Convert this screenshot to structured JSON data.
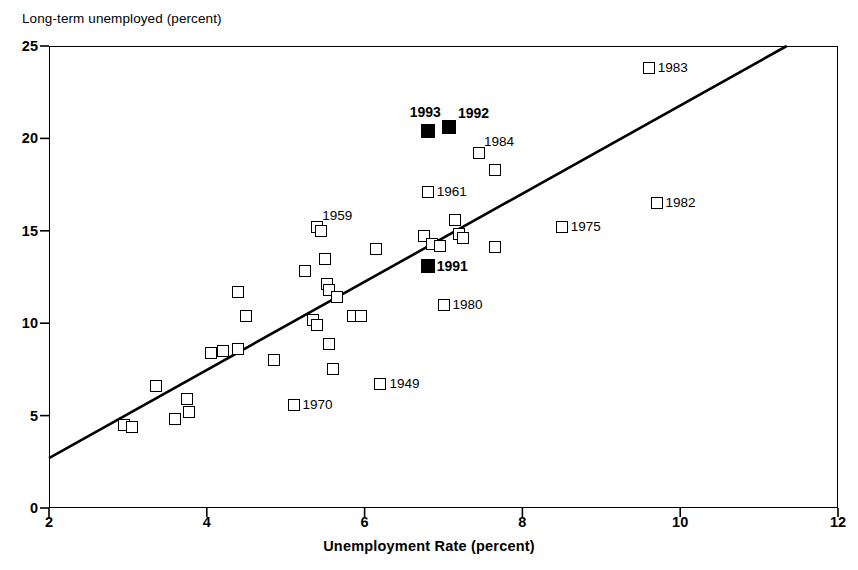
{
  "chart_data": {
    "type": "scatter",
    "title": "",
    "ylabel": "Long-term unemployed (percent)",
    "xlabel": "Unemployment Rate (percent)",
    "xlim": [
      2,
      12
    ],
    "ylim": [
      0,
      25
    ],
    "xticks": [
      "2",
      "4",
      "6",
      "8",
      "10",
      "12"
    ],
    "yticks": [
      "0",
      "5",
      "10",
      "15",
      "20",
      "25"
    ],
    "grid": false,
    "legend": null,
    "series": [
      {
        "name": "Years (open squares)",
        "marker": "open-square",
        "points": [
          {
            "x": 2.95,
            "y": 4.5,
            "label": ""
          },
          {
            "x": 3.05,
            "y": 4.4,
            "label": ""
          },
          {
            "x": 3.35,
            "y": 6.6,
            "label": ""
          },
          {
            "x": 3.6,
            "y": 4.8,
            "label": ""
          },
          {
            "x": 3.75,
            "y": 5.9,
            "label": ""
          },
          {
            "x": 3.78,
            "y": 5.2,
            "label": ""
          },
          {
            "x": 4.05,
            "y": 8.4,
            "label": ""
          },
          {
            "x": 4.2,
            "y": 8.5,
            "label": ""
          },
          {
            "x": 4.4,
            "y": 8.6,
            "label": ""
          },
          {
            "x": 4.4,
            "y": 11.7,
            "label": ""
          },
          {
            "x": 4.5,
            "y": 10.4,
            "label": ""
          },
          {
            "x": 4.85,
            "y": 8.0,
            "label": ""
          },
          {
            "x": 5.1,
            "y": 5.6,
            "label": "1970"
          },
          {
            "x": 5.25,
            "y": 12.8,
            "label": ""
          },
          {
            "x": 5.4,
            "y": 15.2,
            "label": "1959"
          },
          {
            "x": 5.45,
            "y": 15.0,
            "label": ""
          },
          {
            "x": 5.35,
            "y": 10.2,
            "label": ""
          },
          {
            "x": 5.4,
            "y": 9.9,
            "label": ""
          },
          {
            "x": 5.5,
            "y": 13.5,
            "label": ""
          },
          {
            "x": 5.52,
            "y": 12.1,
            "label": ""
          },
          {
            "x": 5.55,
            "y": 11.8,
            "label": ""
          },
          {
            "x": 5.55,
            "y": 8.9,
            "label": ""
          },
          {
            "x": 5.6,
            "y": 7.5,
            "label": ""
          },
          {
            "x": 5.65,
            "y": 11.4,
            "label": ""
          },
          {
            "x": 5.85,
            "y": 10.4,
            "label": ""
          },
          {
            "x": 5.95,
            "y": 10.4,
            "label": ""
          },
          {
            "x": 6.15,
            "y": 14.0,
            "label": ""
          },
          {
            "x": 6.2,
            "y": 6.7,
            "label": "1949"
          },
          {
            "x": 6.75,
            "y": 14.7,
            "label": ""
          },
          {
            "x": 6.8,
            "y": 17.1,
            "label": "1961"
          },
          {
            "x": 6.85,
            "y": 14.3,
            "label": ""
          },
          {
            "x": 6.95,
            "y": 14.2,
            "label": ""
          },
          {
            "x": 7.0,
            "y": 11.0,
            "label": "1980"
          },
          {
            "x": 7.15,
            "y": 15.6,
            "label": ""
          },
          {
            "x": 7.2,
            "y": 14.8,
            "label": ""
          },
          {
            "x": 7.25,
            "y": 14.6,
            "label": ""
          },
          {
            "x": 7.45,
            "y": 19.2,
            "label": "1984"
          },
          {
            "x": 7.65,
            "y": 18.3,
            "label": ""
          },
          {
            "x": 7.65,
            "y": 14.1,
            "label": ""
          },
          {
            "x": 8.5,
            "y": 15.2,
            "label": "1975"
          },
          {
            "x": 9.6,
            "y": 23.8,
            "label": "1983"
          },
          {
            "x": 9.7,
            "y": 16.5,
            "label": "1982"
          }
        ]
      },
      {
        "name": "Recent years (filled squares)",
        "marker": "filled-square",
        "points": [
          {
            "x": 6.8,
            "y": 13.1,
            "label": "1991"
          },
          {
            "x": 6.8,
            "y": 20.4,
            "label": "1993"
          },
          {
            "x": 7.07,
            "y": 20.6,
            "label": "1992"
          }
        ]
      }
    ],
    "trendline": {
      "x0": 2.0,
      "y0": 2.7,
      "x1": 11.35,
      "y1": 25.0
    }
  },
  "colors": {
    "ink": "#000000",
    "background": "#ffffff"
  }
}
